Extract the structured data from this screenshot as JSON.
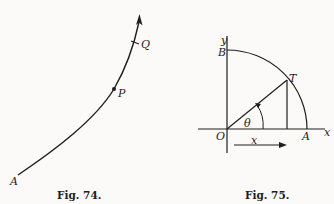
{
  "figures": [
    {
      "caption": "Fig. 74.",
      "labels": {
        "A": "A",
        "P": "P",
        "Q": "Q"
      },
      "description": "Curve from A through P and Q with direction arrow at the top"
    },
    {
      "caption": "Fig. 75.",
      "labels": {
        "y": "y",
        "B": "B",
        "T": "T",
        "theta": "θ",
        "O": "O",
        "x_arrow": "x",
        "A": "A",
        "x_axis": "x"
      },
      "description": "Quarter circle arc from A to B centered at O, radius OT at angle θ, perpendicular from T to x-axis, arrow labeled x below axis"
    }
  ],
  "colors": {
    "ink": "#1e1e1e",
    "paper": "#fbfaf8"
  }
}
